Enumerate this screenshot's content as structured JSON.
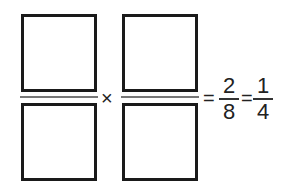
{
  "equation": {
    "fraction1": {
      "numerator": "",
      "denominator": ""
    },
    "operator_times": "×",
    "fraction2": {
      "numerator": "",
      "denominator": ""
    },
    "equals1": "=",
    "result": {
      "numerator": "2",
      "denominator": "8"
    },
    "equals2": "=",
    "simplified": {
      "numerator": "1",
      "denominator": "4"
    }
  }
}
